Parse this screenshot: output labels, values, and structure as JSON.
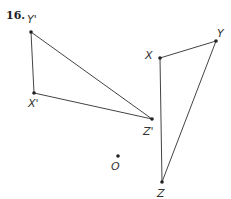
{
  "problem": {
    "number": "16."
  },
  "triangles": [
    {
      "name": "image",
      "vertices": [
        {
          "label": "Y'",
          "x": 31,
          "y": 32,
          "lx": 27,
          "ly": 23
        },
        {
          "label": "X'",
          "x": 34,
          "y": 93,
          "lx": 28,
          "ly": 107
        },
        {
          "label": "Z'",
          "x": 152,
          "y": 119,
          "lx": 143,
          "ly": 135
        }
      ]
    },
    {
      "name": "preimage",
      "vertices": [
        {
          "label": "X",
          "x": 160,
          "y": 58,
          "lx": 145,
          "ly": 59
        },
        {
          "label": "Y",
          "x": 216,
          "y": 41,
          "lx": 217,
          "ly": 37
        },
        {
          "label": "Z",
          "x": 162,
          "y": 182,
          "lx": 157,
          "ly": 197
        }
      ]
    }
  ],
  "center": {
    "label": "O",
    "x": 118,
    "y": 156,
    "lx": 111,
    "ly": 170
  },
  "colors": {
    "line": "#444444",
    "point": "#222222"
  }
}
